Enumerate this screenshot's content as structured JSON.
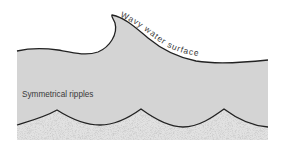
{
  "diagram": {
    "labels": {
      "surface": "Wavy water surface",
      "ripples": "Symmetrical ripples"
    },
    "colors": {
      "background": "#ffffff",
      "water": "#d4d4d4",
      "sand": "#e2e2e2",
      "sand_speckle": "#b8b8b8",
      "outline": "#222222",
      "text": "#3a3a3a"
    }
  }
}
